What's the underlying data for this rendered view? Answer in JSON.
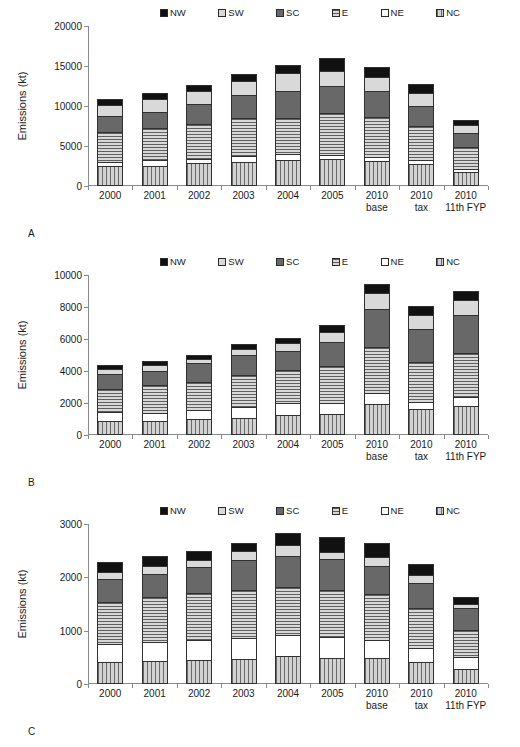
{
  "figure": {
    "panels": [
      {
        "letter": "A"
      },
      {
        "letter": "B"
      },
      {
        "letter": "C"
      }
    ]
  },
  "legend": {
    "items": [
      {
        "label": "NW",
        "color": "#111111",
        "pattern": "solid-black"
      },
      {
        "label": "SW",
        "color": "#d9d9d9",
        "pattern": "solid-light"
      },
      {
        "label": "SC",
        "color": "#686868",
        "pattern": "solid-dark-gray"
      },
      {
        "label": "E",
        "color": "#b9b9b9",
        "pattern": "horizontal-lines"
      },
      {
        "label": "NE",
        "color": "#ffffff",
        "pattern": "solid-white"
      },
      {
        "label": "NC",
        "color": "#bdbdbd",
        "pattern": "vertical-lines"
      }
    ]
  },
  "axis": {
    "ylabel": "Emissions (kt)"
  },
  "categories": [
    {
      "line1": "2000",
      "line2": ""
    },
    {
      "line1": "2001",
      "line2": ""
    },
    {
      "line1": "2002",
      "line2": ""
    },
    {
      "line1": "2003",
      "line2": ""
    },
    {
      "line1": "2004",
      "line2": ""
    },
    {
      "line1": "2005",
      "line2": ""
    },
    {
      "line1": "2010",
      "line2": "base"
    },
    {
      "line1": "2010",
      "line2": "tax"
    },
    {
      "line1": "2010",
      "line2": "11th FYP"
    }
  ],
  "chart_data": [
    {
      "type": "bar",
      "panel": "A",
      "stacked": true,
      "title": "",
      "xlabel": "",
      "ylabel": "Emissions (kt)",
      "ylim": [
        0,
        20000
      ],
      "yticks": [
        0,
        5000,
        10000,
        15000,
        20000
      ],
      "ytick_labels": [
        "0",
        "5000",
        "10000",
        "15000",
        "20000"
      ],
      "grid": false,
      "legend_position": "top-center",
      "categories": [
        "2000",
        "2001",
        "2002",
        "2003",
        "2004",
        "2005",
        "2010 base",
        "2010 tax",
        "2010 11th FYP"
      ],
      "series": [
        {
          "name": "NC",
          "values": [
            2450,
            2530,
            2850,
            2980,
            3260,
            3330,
            3180,
            2780,
            1720
          ]
        },
        {
          "name": "NE",
          "values": [
            600,
            720,
            480,
            750,
            680,
            600,
            440,
            420,
            400
          ]
        },
        {
          "name": "E",
          "values": [
            3750,
            4000,
            4480,
            4800,
            4580,
            5170,
            5010,
            4290,
            2790
          ]
        },
        {
          "name": "SC",
          "values": [
            1900,
            2010,
            2410,
            2830,
            3330,
            3420,
            3260,
            2530,
            1770
          ]
        },
        {
          "name": "SW",
          "values": [
            1450,
            1600,
            1620,
            1780,
            2250,
            1850,
            1760,
            1580,
            900
          ]
        },
        {
          "name": "NW",
          "values": [
            790,
            820,
            780,
            890,
            1090,
            1630,
            1240,
            1120,
            710
          ]
        }
      ],
      "totals": [
        10940,
        11680,
        12620,
        14030,
        15190,
        16000,
        14890,
        12720,
        8290
      ]
    },
    {
      "type": "bar",
      "panel": "B",
      "stacked": true,
      "title": "",
      "xlabel": "",
      "ylabel": "Emissions (kt)",
      "ylim": [
        0,
        10000
      ],
      "yticks": [
        0,
        2000,
        4000,
        6000,
        8000,
        10000
      ],
      "ytick_labels": [
        "0",
        "2000",
        "4000",
        "6000",
        "8000",
        "10000"
      ],
      "grid": false,
      "legend_position": "top-center",
      "categories": [
        "2000",
        "2001",
        "2002",
        "2003",
        "2004",
        "2005",
        "2010 base",
        "2010 tax",
        "2010 11th FYP"
      ],
      "series": [
        {
          "name": "NC",
          "values": [
            900,
            890,
            1010,
            1090,
            1250,
            1330,
            1960,
            1620,
            1830
          ]
        },
        {
          "name": "NE",
          "values": [
            510,
            510,
            570,
            660,
            730,
            690,
            640,
            470,
            560
          ]
        },
        {
          "name": "E",
          "values": [
            1480,
            1700,
            1740,
            2020,
            2080,
            2310,
            2930,
            2480,
            2730
          ]
        },
        {
          "name": "SC",
          "values": [
            900,
            930,
            1180,
            1250,
            1190,
            1490,
            2340,
            2080,
            2370
          ]
        },
        {
          "name": "SW",
          "values": [
            310,
            320,
            230,
            360,
            490,
            640,
            1010,
            880,
            930
          ]
        },
        {
          "name": "NW",
          "values": [
            280,
            290,
            290,
            330,
            330,
            420,
            540,
            560,
            610
          ]
        }
      ],
      "totals": [
        4380,
        4640,
        5020,
        5710,
        6070,
        6880,
        9420,
        8090,
        9030
      ]
    },
    {
      "type": "bar",
      "panel": "C",
      "stacked": true,
      "title": "",
      "xlabel": "",
      "ylabel": "Emissions (kt)",
      "ylim": [
        0,
        3000
      ],
      "yticks": [
        0,
        1000,
        2000,
        3000
      ],
      "ytick_labels": [
        "0",
        "1000",
        "2000",
        "3000"
      ],
      "grid": false,
      "legend_position": "top-center",
      "categories": [
        "2000",
        "2001",
        "2002",
        "2003",
        "2004",
        "2005",
        "2010 base",
        "2010 tax",
        "2010 11th FYP"
      ],
      "series": [
        {
          "name": "NC",
          "values": [
            420,
            430,
            450,
            470,
            520,
            480,
            480,
            410,
            280
          ]
        },
        {
          "name": "NE",
          "values": [
            330,
            360,
            370,
            400,
            390,
            400,
            340,
            260,
            230
          ]
        },
        {
          "name": "E",
          "values": [
            790,
            840,
            880,
            900,
            910,
            880,
            870,
            760,
            510
          ]
        },
        {
          "name": "SC",
          "values": [
            430,
            430,
            490,
            560,
            580,
            580,
            530,
            460,
            400
          ]
        },
        {
          "name": "SW",
          "values": [
            130,
            150,
            130,
            160,
            200,
            140,
            160,
            150,
            80
          ]
        },
        {
          "name": "NW",
          "values": [
            180,
            200,
            180,
            160,
            240,
            270,
            270,
            220,
            130
          ]
        }
      ],
      "totals": [
        2280,
        2410,
        2500,
        2650,
        2840,
        2750,
        2650,
        2260,
        1630
      ]
    }
  ]
}
